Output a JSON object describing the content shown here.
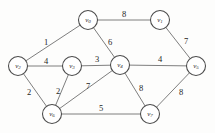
{
  "figure": {
    "kind": "weighted-undirected-graph",
    "background_color": "#fdfdfc",
    "edge_color": "#6f6f6f",
    "node_fill_color": "#ffffff",
    "node_stroke_color": "#4a4a4a",
    "label_color": "#1d1d1d"
  },
  "nodes": [
    {
      "id": "v0",
      "name": "v",
      "sub": "0",
      "x": 88,
      "y": 20,
      "r": 9.5
    },
    {
      "id": "v1",
      "name": "v",
      "sub": "1",
      "x": 160,
      "y": 20,
      "r": 9.5
    },
    {
      "id": "v2",
      "name": "v",
      "sub": "2",
      "x": 18,
      "y": 66,
      "r": 9.5
    },
    {
      "id": "v3",
      "name": "v",
      "sub": "3",
      "x": 72,
      "y": 66,
      "r": 9.5
    },
    {
      "id": "v4",
      "name": "v",
      "sub": "4",
      "x": 120,
      "y": 65,
      "r": 9.5
    },
    {
      "id": "v5",
      "name": "v",
      "sub": "5",
      "x": 196,
      "y": 66,
      "r": 9.5
    },
    {
      "id": "v6",
      "name": "v",
      "sub": "6",
      "x": 52,
      "y": 114,
      "r": 9.5
    },
    {
      "id": "v7",
      "name": "v",
      "sub": "7",
      "x": 150,
      "y": 114,
      "r": 9.5
    }
  ],
  "edges": [
    {
      "id": "e-v0-v1",
      "from": "v0",
      "to": "v1",
      "weight": "8",
      "lx": 124,
      "ly": 14
    },
    {
      "id": "e-v0-v2",
      "from": "v0",
      "to": "v2",
      "weight": "1",
      "lx": 46,
      "ly": 42
    },
    {
      "id": "e-v0-v4",
      "from": "v0",
      "to": "v4",
      "weight": "6",
      "lx": 110,
      "ly": 42
    },
    {
      "id": "e-v1-v5",
      "from": "v1",
      "to": "v5",
      "weight": "7",
      "lx": 186,
      "ly": 41
    },
    {
      "id": "e-v2-v3",
      "from": "v2",
      "to": "v3",
      "weight": "4",
      "lx": 46,
      "ly": 61
    },
    {
      "id": "e-v2-v6",
      "from": "v2",
      "to": "v6",
      "weight": "2",
      "lx": 29,
      "ly": 92
    },
    {
      "id": "e-v3-v4",
      "from": "v3",
      "to": "v4",
      "weight": "3",
      "lx": 97,
      "ly": 59
    },
    {
      "id": "e-v3-v6",
      "from": "v3",
      "to": "v6",
      "weight": "2",
      "lx": 58,
      "ly": 91
    },
    {
      "id": "e-v4-v5",
      "from": "v4",
      "to": "v5",
      "weight": "4",
      "lx": 160,
      "ly": 59
    },
    {
      "id": "e-v4-v6",
      "from": "v4",
      "to": "v6",
      "weight": "7",
      "lx": 88,
      "ly": 86
    },
    {
      "id": "e-v4-v7",
      "from": "v4",
      "to": "v7",
      "weight": "8",
      "lx": 141,
      "ly": 88
    },
    {
      "id": "e-v5-v7",
      "from": "v5",
      "to": "v7",
      "weight": "8",
      "lx": 181,
      "ly": 92
    },
    {
      "id": "e-v6-v7",
      "from": "v6",
      "to": "v7",
      "weight": "5",
      "lx": 101,
      "ly": 108
    }
  ]
}
